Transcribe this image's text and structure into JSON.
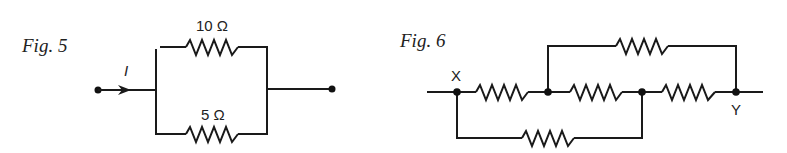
{
  "figures": [
    {
      "label": "Fig. 5",
      "current_label": "I",
      "resistors": [
        {
          "position": "top",
          "value": "10 Ω"
        },
        {
          "position": "bottom",
          "value": "5 Ω"
        }
      ],
      "topology": "two resistors in parallel between input and output terminals"
    },
    {
      "label": "Fig. 6",
      "nodes": {
        "start": "X",
        "end": "Y"
      },
      "resistors": [
        {
          "position": "main-1",
          "between": "X–N1"
        },
        {
          "position": "main-2",
          "between": "N1–N2"
        },
        {
          "position": "main-3",
          "between": "N2–Y"
        },
        {
          "position": "top-bypass",
          "between": "N1–Y"
        },
        {
          "position": "bottom-bypass",
          "between": "X–N2"
        }
      ],
      "topology": "five unlabeled resistors bridged between X and Y"
    }
  ],
  "colors": {
    "ink": "#1a1a1a",
    "background": "#ffffff"
  }
}
